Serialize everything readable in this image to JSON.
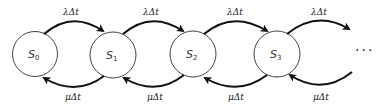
{
  "diagram": {
    "type": "birth-death state transition chain",
    "states": [
      {
        "name": "S",
        "sub": "0",
        "cx": 35,
        "cy": 54
      },
      {
        "name": "S",
        "sub": "1",
        "cx": 113,
        "cy": 55
      },
      {
        "name": "S",
        "sub": "2",
        "cx": 193,
        "cy": 54
      },
      {
        "name": "S",
        "sub": "3",
        "cx": 277,
        "cy": 54
      }
    ],
    "forward_label": "λΔt",
    "backward_label": "μΔt",
    "labels": {
      "f0": "λΔt",
      "f1": "λΔt",
      "f2": "λΔt",
      "f3": "λΔt",
      "b0": "μΔt",
      "b1": "μΔt",
      "b2": "μΔt",
      "b3": "μΔt"
    },
    "continuation": "···",
    "colors": {
      "stroke": "#111111",
      "circle": "#444444",
      "background": "#ffffff"
    }
  }
}
